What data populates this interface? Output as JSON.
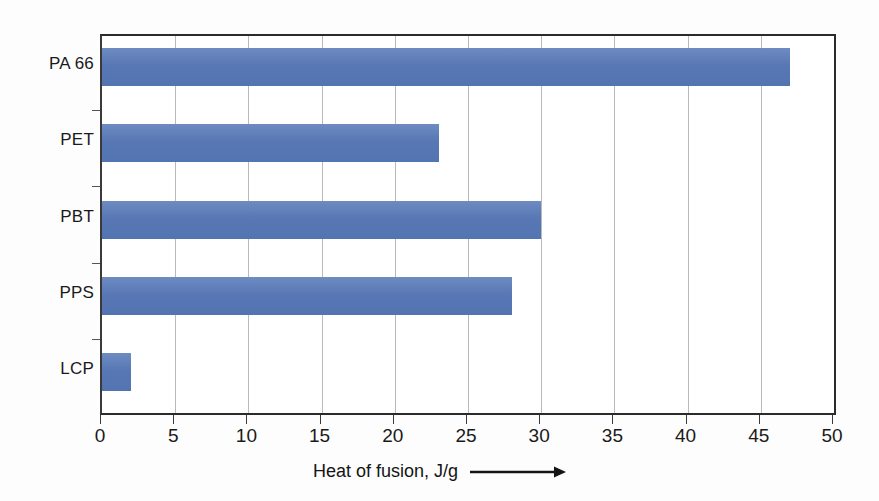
{
  "chart_data": {
    "type": "bar",
    "orientation": "horizontal",
    "title": "",
    "xlabel": "Heat of fusion, J/g",
    "ylabel": "",
    "categories": [
      "PA 66",
      "PET",
      "PBT",
      "PPS",
      "LCP"
    ],
    "values": [
      47,
      23,
      30,
      28,
      2
    ],
    "series": [
      {
        "name": "Heat of fusion",
        "values": [
          47,
          23,
          30,
          28,
          2
        ]
      }
    ],
    "xlim": [
      0,
      50
    ],
    "xticks": [
      0,
      5,
      10,
      15,
      20,
      25,
      30,
      35,
      40,
      45,
      50
    ],
    "xtick_labels": [
      "0",
      "5",
      "10",
      "15",
      "20",
      "25",
      "30",
      "35",
      "40",
      "45",
      "50"
    ],
    "grid": "vertical",
    "legend": "none",
    "bar_color": "#5b7cb8",
    "axis_color": "#2b2b2b",
    "gridline_color": "#b9b9b9",
    "background_color": "#ffffff",
    "axis_title_arrow": "→",
    "units": "J/g"
  },
  "axis_title": {
    "text": "Heat of fusion, J/g",
    "arrow_name": "right-arrow-icon"
  }
}
